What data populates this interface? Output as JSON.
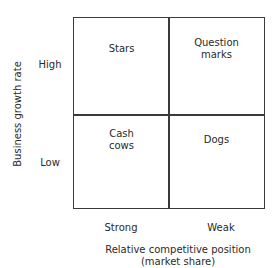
{
  "diagram": {
    "type": "2x2 matrix",
    "y_axis": {
      "title": "Business growth rate",
      "rows": [
        "High",
        "Low"
      ]
    },
    "x_axis": {
      "title_line1": "Relative competitive position",
      "title_line2": "(market share)",
      "columns": [
        "Strong",
        "Weak"
      ]
    },
    "cells": {
      "top_left": "Stars",
      "top_right": "Question\nmarks",
      "bottom_left": "Cash\ncows",
      "bottom_right": "Dogs"
    },
    "colors": {
      "line": "#3a3a3a",
      "text": "#2a2a2a",
      "background": "#ffffff"
    }
  }
}
